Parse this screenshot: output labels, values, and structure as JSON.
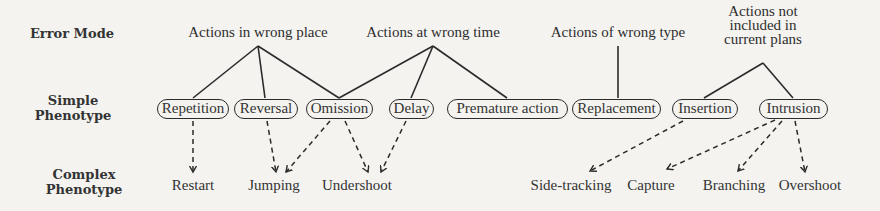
{
  "row_labels": {
    "error_mode": "Error Mode",
    "simple_phenotype": [
      "Simple",
      "Phenotype"
    ],
    "complex_phenotype": [
      "Complex",
      "Phenotype"
    ]
  },
  "error_modes": [
    {
      "id": "wrong_place",
      "lines": [
        "Actions in wrong place"
      ],
      "x": 258
    },
    {
      "id": "wrong_time",
      "lines": [
        "Actions at wrong time"
      ],
      "x": 433
    },
    {
      "id": "wrong_type",
      "lines": [
        "Actions of wrong type"
      ],
      "x": 618
    },
    {
      "id": "not_included",
      "lines": [
        "Actions not",
        "included in",
        "current plans"
      ],
      "x": 763
    }
  ],
  "simple_phenotypes": [
    {
      "id": "repetition",
      "label": "Repetition",
      "left": 157,
      "width": 72
    },
    {
      "id": "reversal",
      "label": "Reversal",
      "left": 234,
      "width": 64
    },
    {
      "id": "omission",
      "label": "Omission",
      "left": 306,
      "width": 67
    },
    {
      "id": "delay",
      "label": "Delay",
      "left": 389,
      "width": 45
    },
    {
      "id": "premature_action",
      "label": "Premature action",
      "left": 447,
      "width": 121
    },
    {
      "id": "replacement",
      "label": "Replacement",
      "left": 572,
      "width": 89
    },
    {
      "id": "insertion",
      "label": "Insertion",
      "left": 672,
      "width": 66
    },
    {
      "id": "intrusion",
      "label": "Intrusion",
      "left": 759,
      "width": 69
    }
  ],
  "complex_phenotypes": [
    {
      "id": "restart",
      "label": "Restart",
      "x": 193
    },
    {
      "id": "jumping",
      "label": "Jumping",
      "x": 274
    },
    {
      "id": "undershoot",
      "label": "Undershoot",
      "x": 357
    },
    {
      "id": "side_tracking",
      "label": "Side-tracking",
      "x": 571
    },
    {
      "id": "capture",
      "label": "Capture",
      "x": 651
    },
    {
      "id": "branching",
      "label": "Branching",
      "x": 734
    },
    {
      "id": "overshoot",
      "label": "Overshoot",
      "x": 810
    }
  ],
  "solid_edges": [
    {
      "from": "wrong_place",
      "to": "repetition",
      "x1": 258,
      "y1": 46,
      "x2": 193,
      "y2": 98
    },
    {
      "from": "wrong_place",
      "to": "reversal",
      "x1": 258,
      "y1": 46,
      "x2": 265,
      "y2": 98
    },
    {
      "from": "wrong_place",
      "to": "omission",
      "x1": 258,
      "y1": 46,
      "x2": 339,
      "y2": 98
    },
    {
      "from": "wrong_time",
      "to": "omission",
      "x1": 433,
      "y1": 46,
      "x2": 339,
      "y2": 98
    },
    {
      "from": "wrong_time",
      "to": "delay",
      "x1": 433,
      "y1": 46,
      "x2": 411,
      "y2": 98
    },
    {
      "from": "wrong_time",
      "to": "premature_action",
      "x1": 433,
      "y1": 46,
      "x2": 507,
      "y2": 98
    },
    {
      "from": "wrong_type",
      "to": "replacement",
      "x1": 618,
      "y1": 46,
      "x2": 618,
      "y2": 98
    },
    {
      "from": "not_included",
      "to": "insertion",
      "x1": 763,
      "y1": 63,
      "x2": 704,
      "y2": 98
    },
    {
      "from": "not_included",
      "to": "intrusion",
      "x1": 763,
      "y1": 63,
      "x2": 793,
      "y2": 98
    }
  ],
  "dashed_edges": [
    {
      "from": "repetition",
      "to": "restart",
      "x1": 193,
      "y1": 121,
      "x2": 193,
      "y2": 172
    },
    {
      "from": "reversal",
      "to": "jumping",
      "x1": 267,
      "y1": 121,
      "x2": 276,
      "y2": 172
    },
    {
      "from": "omission",
      "to": "jumping",
      "x1": 330,
      "y1": 121,
      "x2": 286,
      "y2": 172
    },
    {
      "from": "omission",
      "to": "undershoot",
      "x1": 345,
      "y1": 121,
      "x2": 368,
      "y2": 172
    },
    {
      "from": "delay",
      "to": "undershoot",
      "x1": 406,
      "y1": 121,
      "x2": 381,
      "y2": 172
    },
    {
      "from": "insertion",
      "to": "side_tracking",
      "x1": 683,
      "y1": 121,
      "x2": 590,
      "y2": 171
    },
    {
      "from": "intrusion",
      "to": "capture",
      "x1": 775,
      "y1": 120,
      "x2": 667,
      "y2": 169
    },
    {
      "from": "intrusion",
      "to": "branching",
      "x1": 782,
      "y1": 121,
      "x2": 738,
      "y2": 171
    },
    {
      "from": "intrusion",
      "to": "overshoot",
      "x1": 795,
      "y1": 121,
      "x2": 805,
      "y2": 172
    }
  ],
  "colors": {
    "background": "#f4f3f0",
    "ink": "#2b2b2b",
    "text": "#333333"
  }
}
